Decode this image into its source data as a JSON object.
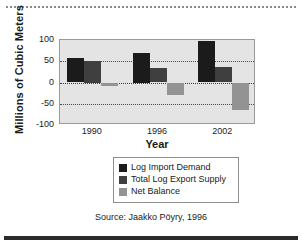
{
  "chart_data": {
    "type": "bar",
    "title": "",
    "xlabel": "Year",
    "ylabel": "Millions of Cubic Meters",
    "categories": [
      "1990",
      "1996",
      "2002"
    ],
    "series": [
      {
        "name": "Log Import Demand",
        "color": "#1b1b1b",
        "values": [
          57,
          70,
          97
        ]
      },
      {
        "name": "Total Log Export Supply",
        "color": "#3f3f3f",
        "values": [
          50,
          33,
          37
        ]
      },
      {
        "name": "Net Balance",
        "color": "#939393",
        "values": [
          -8,
          -30,
          -65
        ]
      }
    ],
    "ylim": [
      -100,
      100
    ],
    "yticks": [
      "100",
      "50",
      "0",
      "-50",
      "-100"
    ],
    "ytick_values": [
      100,
      50,
      0,
      -50,
      -100
    ],
    "grid": true,
    "legend_position": "below-plot",
    "plot_background": "#e4e4e4"
  },
  "source": {
    "text": "Source: Jaakko Pöyry, 1996"
  }
}
